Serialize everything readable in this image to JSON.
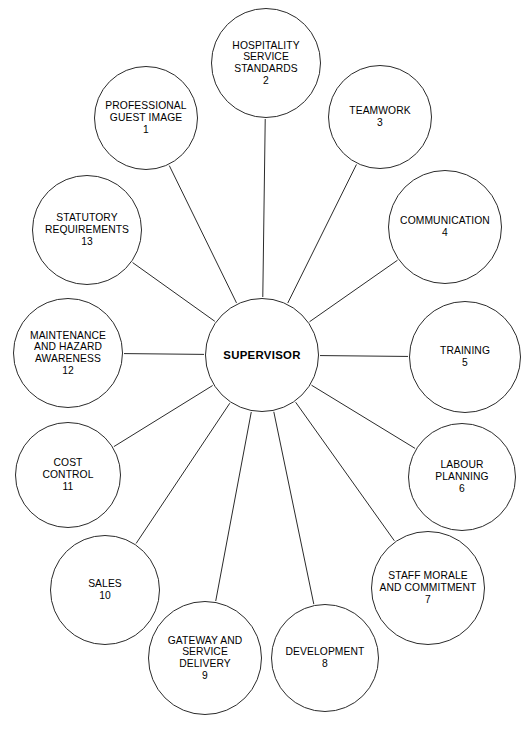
{
  "diagram": {
    "type": "radial-spoke-diagram",
    "title_visible": false,
    "background_color": "#ffffff",
    "line_color": "#2b2b2b",
    "text_color": "#000000",
    "center": {
      "label": "SUPERVISOR",
      "cx": 262,
      "cy": 355,
      "r": 57
    },
    "satellites": [
      {
        "number": "1",
        "label": "PROFESSIONAL\nGUEST IMAGE\n1",
        "cx": 146,
        "cy": 118,
        "r": 52
      },
      {
        "number": "2",
        "label": "HOSPITALITY\nSERVICE\nSTANDARDS\n2",
        "cx": 266,
        "cy": 63,
        "r": 55
      },
      {
        "number": "3",
        "label": "TEAMWORK\n3",
        "cx": 380,
        "cy": 117,
        "r": 52
      },
      {
        "number": "4",
        "label": "COMMUNICATION\n4",
        "cx": 445,
        "cy": 227,
        "r": 57
      },
      {
        "number": "5",
        "label": "TRAINING\n5",
        "cx": 465,
        "cy": 357,
        "r": 56
      },
      {
        "number": "6",
        "label": "LABOUR\nPLANNING\n6",
        "cx": 462,
        "cy": 477,
        "r": 54
      },
      {
        "number": "7",
        "label": "STAFF MORALE\nAND COMMITMENT\n7",
        "cx": 428,
        "cy": 588,
        "r": 57
      },
      {
        "number": "8",
        "label": "DEVELOPMENT\n8",
        "cx": 325,
        "cy": 658,
        "r": 54
      },
      {
        "number": "9",
        "label": "GATEWAY AND\nSERVICE\nDELIVERY\n9",
        "cx": 205,
        "cy": 658,
        "r": 57
      },
      {
        "number": "10",
        "label": "SALES\n10",
        "cx": 105,
        "cy": 590,
        "r": 55
      },
      {
        "number": "11",
        "label": "COST\nCONTROL\n11",
        "cx": 68,
        "cy": 475,
        "r": 53
      },
      {
        "number": "12",
        "label": "MAINTENANCE\nAND HAZARD\nAWARENESS\n12",
        "cx": 68,
        "cy": 353,
        "r": 55
      },
      {
        "number": "13",
        "label": "STATUTORY\nREQUIREMENTS\n13",
        "cx": 87,
        "cy": 230,
        "r": 55
      }
    ]
  }
}
